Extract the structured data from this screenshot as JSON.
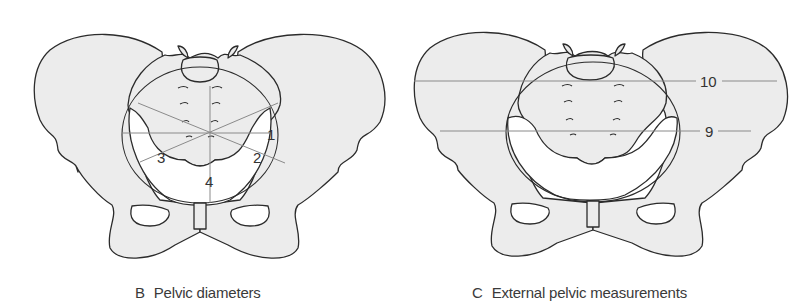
{
  "figure": {
    "panels": [
      {
        "id": "B",
        "letter": "B",
        "title": "Pelvic diameters",
        "labels": [
          "1",
          "2",
          "3",
          "4"
        ]
      },
      {
        "id": "C",
        "letter": "C",
        "title": "External pelvic measurements",
        "labels": [
          "10",
          "9"
        ]
      }
    ],
    "colors": {
      "bone_fill": "#ececec",
      "outline": "#2b2b2b",
      "measure_line": "#8a8a8a",
      "background": "#ffffff"
    }
  }
}
